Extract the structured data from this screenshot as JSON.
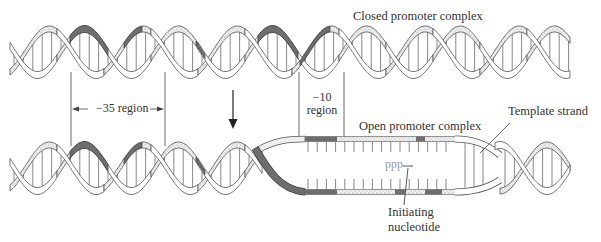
{
  "figure": {
    "type": "dna-promoter-complex-diagram",
    "labels": {
      "closed_complex": "Closed promoter complex",
      "open_complex": "Open promoter complex",
      "template_strand": "Template strand",
      "minus35_region": "−35 region",
      "minus10_line1": "−10",
      "minus10_line2": "region",
      "ppp": "ppp",
      "initiating_line1": "Initiating",
      "initiating_line2": "nucleotide"
    },
    "colors": {
      "strand_outline": "#555555",
      "strand_fill": "#ffffff",
      "back_strand_fill": "#e6e6e6",
      "highlight_region": "#6e6e6e",
      "base_pair_lines": "#555555",
      "text": "#333333",
      "ppp_text": "#999999"
    },
    "top_helix": {
      "y_center": 52,
      "amplitude": 23,
      "x_start": 10,
      "x_end": 570,
      "period": 94
    },
    "bottom_helix": {
      "y_center": 168,
      "amplitude": 23,
      "x_start": 10,
      "x_end": 570,
      "period": 94,
      "bubble": {
        "x_start": 305,
        "x_end": 470,
        "top_y": 139,
        "bottom_y": 192
      }
    }
  }
}
